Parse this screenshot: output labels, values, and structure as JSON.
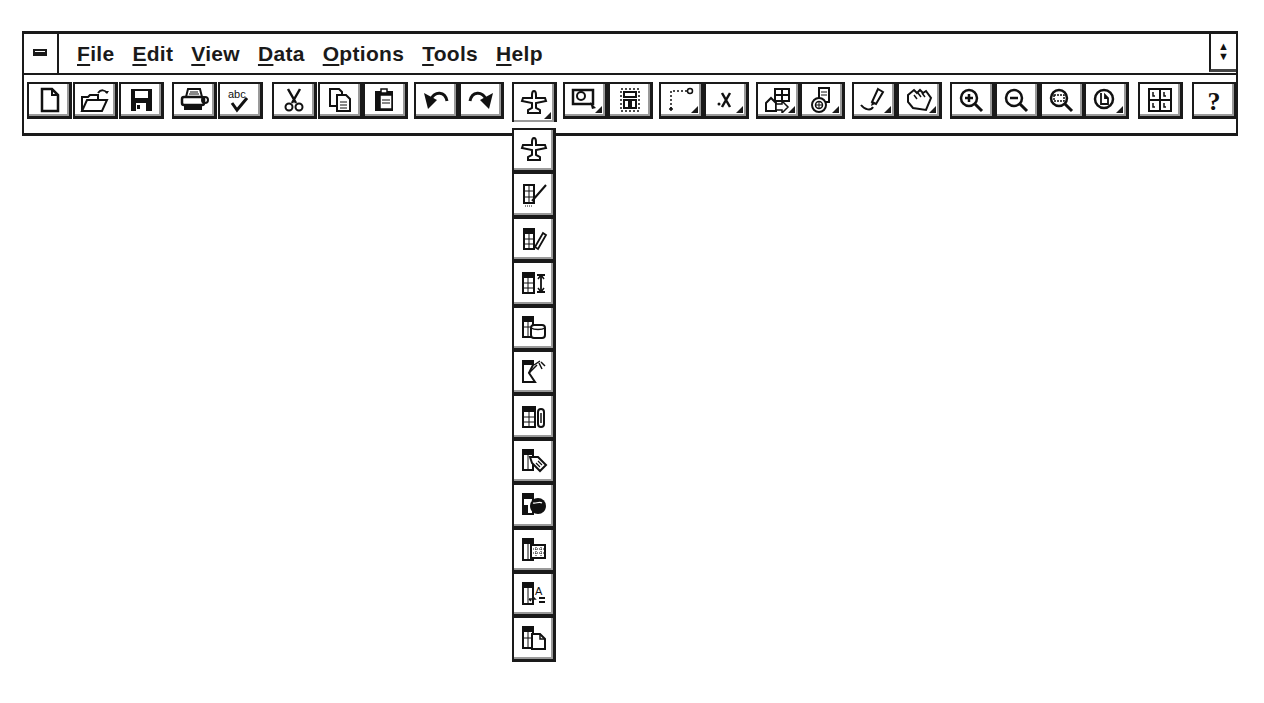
{
  "menubar": {
    "system_menu_icon": "system-menu-icon",
    "items": [
      {
        "label": "File",
        "mnemonic": "F",
        "rest": "ile"
      },
      {
        "label": "Edit",
        "mnemonic": "E",
        "rest": "dit"
      },
      {
        "label": "View",
        "mnemonic": "V",
        "rest": "iew"
      },
      {
        "label": "Data",
        "mnemonic": "D",
        "rest": "ata"
      },
      {
        "label": "Options",
        "mnemonic": "O",
        "rest": "ptions"
      },
      {
        "label": "Tools",
        "mnemonic": "T",
        "rest": "ools"
      },
      {
        "label": "Help",
        "mnemonic": "H",
        "rest": "elp"
      }
    ],
    "restore_icon": "restore-arrows-icon",
    "restore_glyph": "▲▼"
  },
  "toolbar": {
    "buttons": [
      {
        "name": "new",
        "icon": "new-document-icon"
      },
      {
        "name": "open",
        "icon": "open-folder-icon"
      },
      {
        "name": "save",
        "icon": "save-disk-icon"
      },
      {
        "name": "print",
        "icon": "printer-icon"
      },
      {
        "name": "spell-check",
        "icon": "spell-check-icon",
        "text": "abc"
      },
      {
        "name": "cut",
        "icon": "scissors-icon"
      },
      {
        "name": "copy",
        "icon": "copy-icon"
      },
      {
        "name": "paste",
        "icon": "clipboard-icon"
      },
      {
        "name": "undo",
        "icon": "undo-icon"
      },
      {
        "name": "redo",
        "icon": "redo-icon"
      },
      {
        "name": "object-tools",
        "icon": "plane-icon",
        "pressed": true,
        "has_dropdown": true
      },
      {
        "name": "select-frame",
        "icon": "select-frame-icon",
        "has_dropdown": true
      },
      {
        "name": "layout",
        "icon": "layout-icon"
      },
      {
        "name": "line",
        "icon": "dotted-line-icon",
        "has_dropdown": true
      },
      {
        "name": "mark",
        "icon": "x-mark-icon",
        "text": ".X",
        "has_dropdown": true
      },
      {
        "name": "group",
        "icon": "group-shapes-icon",
        "has_dropdown": true
      },
      {
        "name": "database",
        "icon": "database-icon",
        "has_dropdown": true
      },
      {
        "name": "draw",
        "icon": "pen-draw-icon",
        "has_dropdown": true
      },
      {
        "name": "hand",
        "icon": "hand-pan-icon",
        "has_dropdown": true
      },
      {
        "name": "zoom-in",
        "icon": "zoom-in-icon"
      },
      {
        "name": "zoom-out",
        "icon": "zoom-out-icon"
      },
      {
        "name": "zoom-area",
        "icon": "zoom-area-icon"
      },
      {
        "name": "zoom-page",
        "icon": "zoom-page-icon",
        "has_dropdown": true
      },
      {
        "name": "grid",
        "icon": "grid-quadrants-icon"
      },
      {
        "name": "help",
        "icon": "help-icon",
        "text": "?"
      }
    ]
  },
  "flyout": {
    "items": [
      {
        "name": "plane",
        "icon": "plane-icon"
      },
      {
        "name": "sheet-line",
        "icon": "sheet-line-icon"
      },
      {
        "name": "sheet-pencil",
        "icon": "sheet-pencil-icon"
      },
      {
        "name": "sheet-resize",
        "icon": "sheet-resize-icon"
      },
      {
        "name": "sheet-cylinder",
        "icon": "sheet-cylinder-icon"
      },
      {
        "name": "sheet-cut",
        "icon": "sheet-cut-icon"
      },
      {
        "name": "sheet-clip",
        "icon": "sheet-paperclip-icon"
      },
      {
        "name": "sheet-tag",
        "icon": "sheet-tag-icon"
      },
      {
        "name": "sheet-globe",
        "icon": "sheet-globe-icon"
      },
      {
        "name": "sheet-grid",
        "icon": "sheet-grid-icon"
      },
      {
        "name": "sheet-text",
        "icon": "sheet-text-icon",
        "text": "A"
      },
      {
        "name": "sheet-page",
        "icon": "sheet-page-icon"
      }
    ]
  }
}
